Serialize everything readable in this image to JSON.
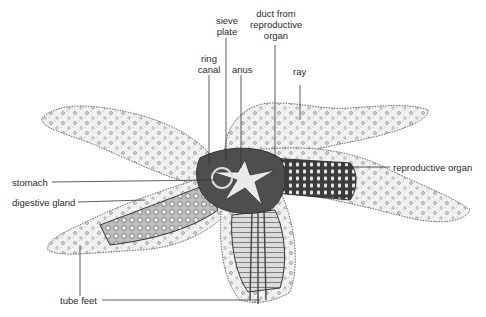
{
  "diagram": {
    "colors": {
      "background": "#ffffff",
      "ink": "#2a2a2a",
      "skin_fill": "#eeeeee",
      "internal_dark": "#555555",
      "internal_light": "#d8d8d8"
    },
    "labels": {
      "sieve_plate": [
        "sieve",
        "plate"
      ],
      "duct": [
        "duct from",
        "reproductive",
        "organ"
      ],
      "ring_canal": [
        "ring",
        "canal"
      ],
      "anus": "anus",
      "ray": "ray",
      "stomach": "stomach",
      "reproductive_organ": "reproductive organ",
      "digestive_gland": "digestive gland",
      "tube_feet": "tube feet"
    }
  }
}
